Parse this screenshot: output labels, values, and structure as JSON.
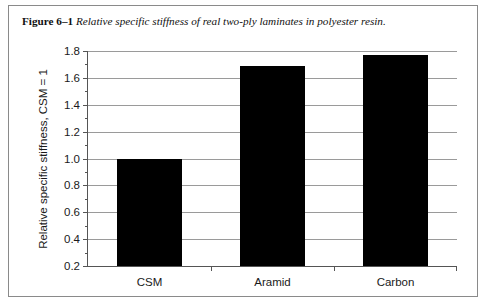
{
  "caption": {
    "figure_number": "Figure 6–1",
    "text": "Relative specific stiffness of real two-ply laminates in polyester resin."
  },
  "chart_data": {
    "type": "bar",
    "title": "",
    "categories": [
      "CSM",
      "Aramid",
      "Carbon"
    ],
    "values": [
      1.0,
      1.69,
      1.77
    ],
    "xlabel": "",
    "ylabel": "Relative specific stiffness, CSM = 1",
    "ylim": [
      0.2,
      1.8
    ],
    "ytick_labels": [
      "1.8",
      "1.6",
      "1.4",
      "1.2",
      "1.0",
      "0.8",
      "0.6",
      "0.4",
      "0.2"
    ],
    "ytick_values": [
      1.8,
      1.6,
      1.4,
      1.2,
      1.0,
      0.8,
      0.6,
      0.4,
      0.2
    ],
    "minor_tick_step": 0.1,
    "grid": true,
    "legend": null,
    "bar_color": "#000000",
    "grid_color": "#9a9a9a",
    "axis_color": "#555555"
  }
}
